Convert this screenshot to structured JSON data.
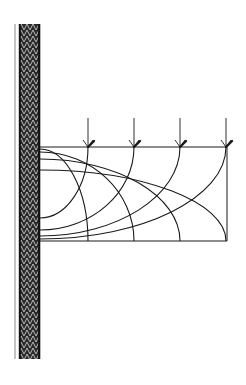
{
  "diagram": {
    "colors": {
      "background": "#ffffff",
      "ink": "#1a1a1a",
      "wall_dark": "#111111",
      "wall_light": "#9a9a9a"
    },
    "wall": {
      "x_left_line": 15,
      "x_band_start": 19,
      "x_band_end": 40,
      "y_top": 24,
      "y_bottom": 359
    },
    "region": {
      "x_left": 40,
      "x_right": 227,
      "y_top": 147,
      "y_bottom": 241
    },
    "loads": [
      {
        "x": 88,
        "y_start": 118,
        "y_end": 147
      },
      {
        "x": 134,
        "y_start": 118,
        "y_end": 147
      },
      {
        "x": 180,
        "y_start": 118,
        "y_end": 147
      },
      {
        "x": 226,
        "y_start": 118,
        "y_end": 147
      }
    ],
    "descending_curves": [
      {
        "wall_y": 149,
        "bottom_x": 88
      },
      {
        "wall_y": 152,
        "bottom_x": 134
      },
      {
        "wall_y": 159,
        "bottom_x": 180
      },
      {
        "wall_y": 170,
        "bottom_x": 226
      }
    ],
    "ascending_curves": [
      {
        "wall_y": 218,
        "top_x": 88
      },
      {
        "wall_y": 230,
        "top_x": 134
      },
      {
        "wall_y": 236,
        "top_x": 180
      },
      {
        "wall_y": 239,
        "top_x": 226
      }
    ]
  }
}
